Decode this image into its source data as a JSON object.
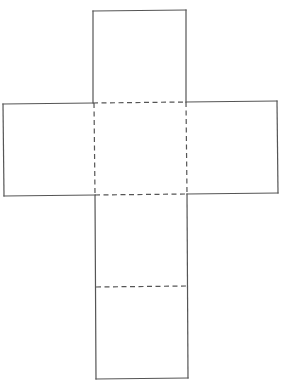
{
  "diagram": {
    "title": "",
    "kind": "cube-net",
    "stroke_color": "#555555",
    "background": "#ffffff",
    "faces": [
      {
        "id": "top",
        "x": 93,
        "y": 10,
        "w": 93,
        "h": 93
      },
      {
        "id": "left",
        "x": 3,
        "y": 104,
        "w": 91,
        "h": 92
      },
      {
        "id": "center",
        "x": 94,
        "y": 103,
        "w": 93,
        "h": 92
      },
      {
        "id": "right",
        "x": 187,
        "y": 101,
        "w": 91,
        "h": 92
      },
      {
        "id": "lower",
        "x": 95,
        "y": 195,
        "w": 93,
        "h": 91
      },
      {
        "id": "bottom",
        "x": 95,
        "y": 286,
        "w": 93,
        "h": 93
      }
    ],
    "solid_edges": [
      {
        "x1": 93,
        "y1": 11,
        "x2": 186,
        "y2": 10
      },
      {
        "x1": 93,
        "y1": 11,
        "x2": 93,
        "y2": 103
      },
      {
        "x1": 186,
        "y1": 10,
        "x2": 186,
        "y2": 102
      },
      {
        "x1": 3,
        "y1": 104,
        "x2": 93,
        "y2": 103
      },
      {
        "x1": 186,
        "y1": 102,
        "x2": 277,
        "y2": 101
      },
      {
        "x1": 3,
        "y1": 104,
        "x2": 4,
        "y2": 196
      },
      {
        "x1": 277,
        "y1": 101,
        "x2": 278,
        "y2": 193
      },
      {
        "x1": 4,
        "y1": 196,
        "x2": 95,
        "y2": 195
      },
      {
        "x1": 187,
        "y1": 194,
        "x2": 278,
        "y2": 193
      },
      {
        "x1": 95,
        "y1": 195,
        "x2": 96,
        "y2": 379
      },
      {
        "x1": 187,
        "y1": 194,
        "x2": 188,
        "y2": 378
      },
      {
        "x1": 96,
        "y1": 379,
        "x2": 188,
        "y2": 378
      }
    ],
    "fold_lines": [
      {
        "x1": 93,
        "y1": 103,
        "x2": 186,
        "y2": 102
      },
      {
        "x1": 94,
        "y1": 103,
        "x2": 95,
        "y2": 195
      },
      {
        "x1": 186,
        "y1": 102,
        "x2": 187,
        "y2": 194
      },
      {
        "x1": 95,
        "y1": 195,
        "x2": 187,
        "y2": 194
      },
      {
        "x1": 96,
        "y1": 287,
        "x2": 188,
        "y2": 286
      }
    ]
  }
}
